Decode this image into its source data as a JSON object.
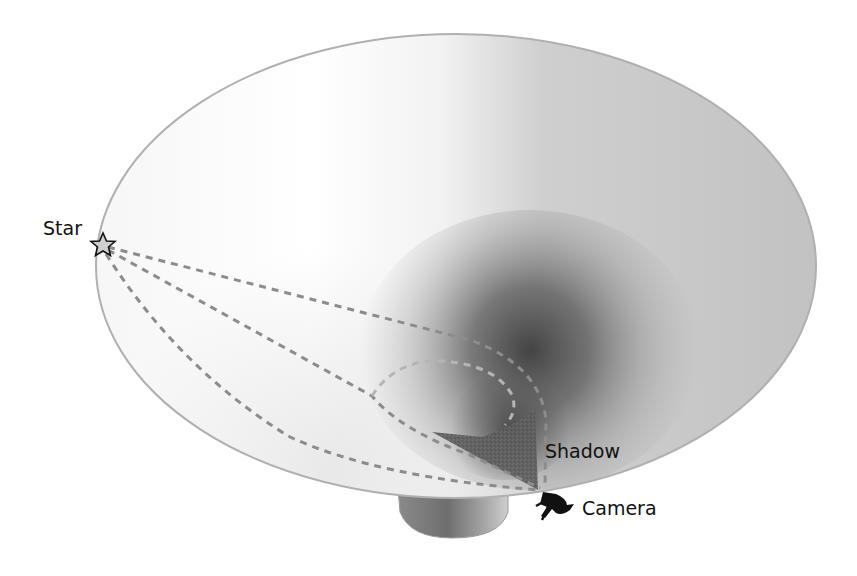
{
  "diagram": {
    "labels": {
      "star": "Star",
      "shadow": "Shadow",
      "camera": "Camera"
    },
    "elements": {
      "dish": "funnel-dish",
      "stem": "dish-stem",
      "star_marker": "star-icon",
      "camera_marker": "camera-icon",
      "shadow_region": "shadow-triangle",
      "light_paths": [
        "light-path-upper",
        "light-path-middle",
        "light-path-lower",
        "light-path-loop"
      ]
    },
    "colors": {
      "dish_light": "#ffffff",
      "dish_mid": "#c8c8c8",
      "dish_dark": "#4a4a4a",
      "rim": "#b0b0b0",
      "dash": "#8c8c8c",
      "shadow_fill": "#5e5e5e",
      "star_fill": "#cfcfcf",
      "text": "#111111"
    }
  }
}
